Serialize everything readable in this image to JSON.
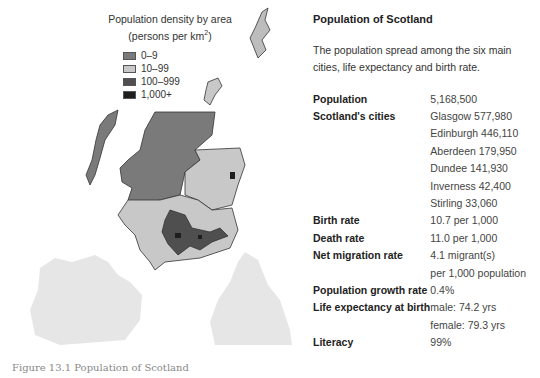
{
  "map": {
    "title_line1": "Population density by area",
    "title_line2": "(persons per km",
    "title_sup": "2",
    "title_close": ")",
    "legend": [
      {
        "label": "0–9",
        "color": "#7a7a7a"
      },
      {
        "label": "10–99",
        "color": "#c8c8c8"
      },
      {
        "label": "100–999",
        "color": "#4f4f4f"
      },
      {
        "label": "1,000+",
        "color": "#1e1e1e"
      }
    ]
  },
  "panel": {
    "title": "Population of Scotland",
    "description": "The population spread among the six main cities, life expectancy and birth rate.",
    "rows": [
      {
        "key": "Population",
        "value": "5,168,500"
      },
      {
        "key": "Scotland's cities",
        "value": "Glasgow 577,980"
      },
      {
        "key": "",
        "value": "Edinburgh 446,110"
      },
      {
        "key": "",
        "value": "Aberdeen 179,950"
      },
      {
        "key": "",
        "value": "Dundee 141,930"
      },
      {
        "key": "",
        "value": "Inverness 42,400"
      },
      {
        "key": "",
        "value": "Stirling 33,060"
      },
      {
        "key": "Birth rate",
        "value": "10.7 per 1,000"
      },
      {
        "key": "Death rate",
        "value": "11.0 per 1,000"
      },
      {
        "key": "Net migration rate",
        "value": "4.1 migrant(s)"
      },
      {
        "key": "",
        "value": "per 1,000 population"
      },
      {
        "key": "Population growth rate",
        "value": "0.4%"
      },
      {
        "key": "Life expectancy at birth",
        "value": "male: 74.2 yrs"
      },
      {
        "key": "",
        "value": "female: 79.3 yrs"
      },
      {
        "key": "Literacy",
        "value": "99%"
      }
    ]
  },
  "caption": "Figure 13.1  Population of Scotland"
}
